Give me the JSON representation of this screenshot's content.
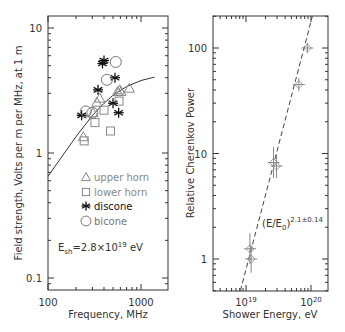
{
  "chart_data": [
    {
      "type": "scatter",
      "title": "",
      "xlabel": "Frequency, MHz",
      "ylabel": "Field strength, Volts per m per MHz, at 1 m",
      "xscale": "log",
      "yscale": "log",
      "xlim": [
        100,
        2000
      ],
      "ylim": [
        0.08,
        13
      ],
      "x_ticks": [
        "100",
        "1000"
      ],
      "y_ticks": [
        "0.1",
        "1",
        "10"
      ],
      "grid": false,
      "legend_position": "inside-center-left",
      "annotation": "E_sh=2.8×10^19 eV",
      "annotation_main": "E",
      "annotation_sub": "sh",
      "annotation_rest": "=2.8×10",
      "annotation_sup": "19",
      "annotation_unit": " eV",
      "series": [
        {
          "name": "upper horn",
          "marker": "triangle",
          "color": "#888888",
          "x": [
            240,
            305,
            335,
            360,
            560,
            590,
            610,
            750
          ],
          "y": [
            1.35,
            2.1,
            2.55,
            2.75,
            3.1,
            3.2,
            3.1,
            3.3
          ]
        },
        {
          "name": "lower horn",
          "marker": "square",
          "color": "#888888",
          "x": [
            245,
            320,
            400,
            470,
            580
          ],
          "y": [
            1.25,
            1.75,
            2.2,
            1.5,
            2.6
          ]
        },
        {
          "name": "discone",
          "marker": "asterisk",
          "color": "#111111",
          "x": [
            230,
            345,
            385,
            400,
            500,
            525,
            575
          ],
          "y": [
            2.0,
            3.2,
            5.2,
            5.5,
            2.5,
            4.0,
            2.1
          ]
        },
        {
          "name": "bicone",
          "marker": "circle",
          "color": "#777777",
          "x": [
            255,
            300,
            430,
            535
          ],
          "y": [
            2.15,
            2.1,
            3.85,
            5.35
          ]
        }
      ],
      "fit_curve": {
        "name": "model",
        "style": "solid",
        "x": [
          100,
          150,
          200,
          300,
          400,
          500,
          700,
          1000,
          1400
        ],
        "y": [
          0.65,
          1.0,
          1.35,
          2.0,
          2.5,
          2.9,
          3.4,
          3.8,
          4.05
        ]
      }
    },
    {
      "type": "scatter",
      "title": "",
      "xlabel": "Shower Energy, eV",
      "ylabel": "Relative Cherenkov Power",
      "xscale": "log",
      "yscale": "log",
      "xlim": [
        3.2e+18,
        1.4e+20
      ],
      "ylim": [
        0.5,
        200
      ],
      "x_ticks": [
        "10^19",
        "10^20"
      ],
      "y_ticks": [
        "1",
        "10",
        "100"
      ],
      "grid": false,
      "annotation": "(E/E_0)^{2.1±0.14}",
      "annotation_main": "(E/E",
      "annotation_sub": "0",
      "annotation_close": ")",
      "annotation_sup": "2.1±0.14",
      "series": [
        {
          "name": "measurements",
          "marker": "cross-errorbar",
          "color": "#888888",
          "x": [
            1.15e+19,
            1.2e+19,
            2.65e+19,
            2.95e+19,
            6.5e+19,
            8.8e+19
          ],
          "y": [
            1.25,
            1.0,
            8.2,
            7.6,
            45,
            100
          ],
          "yerr_factor": [
            1.4,
            1.35,
            1.4,
            1.3,
            1.15,
            1.12
          ]
        }
      ],
      "fit_line": {
        "style": "dashed",
        "x": [
          8.2e+18,
          1.05e+20
        ],
        "y": [
          0.5,
          200
        ]
      }
    }
  ],
  "left": {
    "xlabel": "Frequency, MHz",
    "ylabel": "Field strength, Volts per m per MHz, at 1 m",
    "legend": [
      "upper horn",
      "lower horn",
      "discone",
      "bicone"
    ]
  },
  "right": {
    "xlabel": "Shower Energy, eV",
    "ylabel": "Relative Cherenkov Power"
  }
}
